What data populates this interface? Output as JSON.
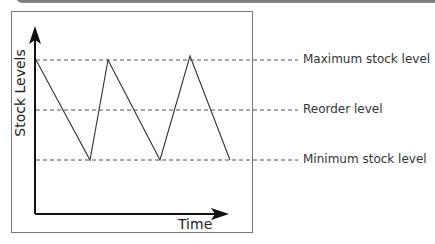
{
  "diagram": {
    "title": "",
    "y_axis_label": "Stock Levels",
    "x_axis_label": "Time",
    "levels": [
      {
        "name": "maximum",
        "label": "Maximum stock level",
        "y": 60
      },
      {
        "name": "reorder",
        "label": "Reorder level",
        "y": 110
      },
      {
        "name": "minimum",
        "label": "Minimum stock level",
        "y": 160
      }
    ],
    "stock_line_points": [
      [
        36,
        60
      ],
      [
        90,
        160
      ],
      [
        108,
        60
      ],
      [
        160,
        160
      ],
      [
        190,
        56
      ],
      [
        230,
        160
      ]
    ],
    "colors": {
      "line": "#333333",
      "axis": "#111111",
      "dash": "#555555",
      "text": "#333333"
    }
  }
}
